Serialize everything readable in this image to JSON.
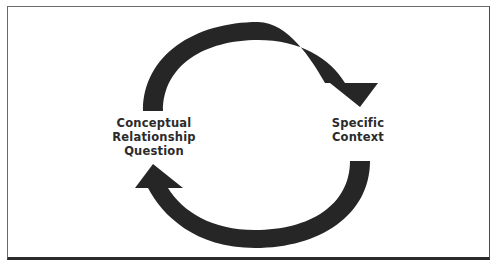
{
  "diagram": {
    "type": "cycle",
    "nodes": [
      {
        "id": "left",
        "lines": [
          "Conceptual",
          "Relationship",
          "Question"
        ]
      },
      {
        "id": "right",
        "lines": [
          "Specific",
          "Context"
        ]
      }
    ],
    "edges": [
      {
        "from": "left",
        "to": "right",
        "path": "top-arc",
        "direction": "clockwise"
      },
      {
        "from": "right",
        "to": "left",
        "path": "bottom-arc",
        "direction": "clockwise"
      }
    ],
    "colors": {
      "arrow": "#262626",
      "text": "#2b2b2b",
      "frame": "#4a4a4a",
      "background": "#ffffff"
    }
  }
}
